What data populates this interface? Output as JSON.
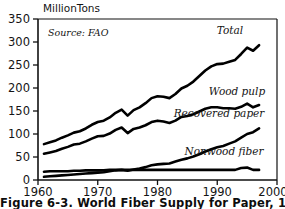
{
  "figure": {
    "caption": "Figure 6-3. World Fiber Supply for Paper, 1961-97",
    "source_note": "Source: FAO",
    "y_axis_title": "MillionTons"
  },
  "chart_data": {
    "type": "line",
    "title": "World Fiber Supply for Paper, 1961-97",
    "subtitle": "Source: FAO",
    "xlabel": "",
    "ylabel": "MillionTons",
    "xlim": [
      1960,
      2000
    ],
    "ylim": [
      0,
      350
    ],
    "xticks": [
      "1960",
      "1970",
      "1980",
      "1990",
      "2000"
    ],
    "yticks": [
      "0",
      "50",
      "100",
      "150",
      "200",
      "250",
      "300",
      "350"
    ],
    "grid": false,
    "legend_position": "inline-right",
    "x": [
      1961,
      1962,
      1963,
      1964,
      1965,
      1966,
      1967,
      1968,
      1969,
      1970,
      1971,
      1972,
      1973,
      1974,
      1975,
      1976,
      1977,
      1978,
      1979,
      1980,
      1981,
      1982,
      1983,
      1984,
      1985,
      1986,
      1987,
      1988,
      1989,
      1990,
      1991,
      1992,
      1993,
      1994,
      1995,
      1996,
      1997
    ],
    "series": [
      {
        "name": "Total",
        "values": [
          78,
          82,
          86,
          92,
          97,
          103,
          106,
          112,
          120,
          126,
          129,
          136,
          146,
          153,
          140,
          152,
          158,
          167,
          178,
          182,
          181,
          178,
          187,
          199,
          205,
          214,
          226,
          238,
          247,
          252,
          253,
          257,
          261,
          274,
          288,
          281,
          293
        ]
      },
      {
        "name": "Wood pulp",
        "values": [
          57,
          60,
          63,
          68,
          72,
          77,
          79,
          84,
          90,
          95,
          96,
          101,
          109,
          114,
          102,
          111,
          114,
          119,
          126,
          129,
          127,
          124,
          129,
          137,
          139,
          143,
          149,
          155,
          158,
          158,
          156,
          156,
          155,
          159,
          166,
          158,
          163
        ]
      },
      {
        "name": "Recovered paper",
        "values": [
          7,
          8,
          9,
          10,
          11,
          12,
          13,
          14,
          15,
          16,
          17,
          19,
          21,
          22,
          20,
          23,
          25,
          28,
          32,
          34,
          35,
          36,
          40,
          44,
          47,
          51,
          56,
          62,
          67,
          71,
          74,
          79,
          84,
          92,
          100,
          104,
          112
        ]
      },
      {
        "name": "Nonwood fiber",
        "values": [
          18,
          19,
          19,
          19,
          19,
          20,
          20,
          21,
          21,
          21,
          21,
          22,
          22,
          22,
          22,
          22,
          22,
          22,
          22,
          22,
          22,
          22,
          22,
          22,
          22,
          22,
          22,
          22,
          22,
          22,
          22,
          22,
          22,
          26,
          27,
          22,
          22
        ]
      }
    ],
    "annotations": [
      {
        "text": "Total",
        "x": 1994,
        "y": 322
      },
      {
        "text": "Wood pulp",
        "x": 1993,
        "y": 196
      },
      {
        "text": "Recovered paper",
        "x": 1989,
        "y": 150
      },
      {
        "text": "Nonwood fiber",
        "x": 1990,
        "y": 72
      },
      {
        "text": "Source: FAO",
        "x": 1962,
        "y": 320
      }
    ]
  },
  "colors": {
    "line": "#000000",
    "axis": "#111111",
    "background": "#ffffff",
    "text": "#141414"
  }
}
